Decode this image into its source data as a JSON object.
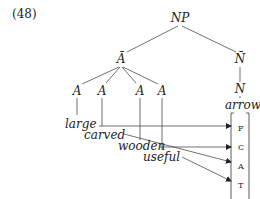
{
  "example_number": "(48)",
  "tree": {
    "root": "NP",
    "a_bar": "Ā",
    "n_bar": "N̄",
    "n": "N",
    "adjective_nodes": [
      "A",
      "A",
      "A",
      "A"
    ],
    "head_word": "arrow"
  },
  "adjectives": [
    {
      "word": "large",
      "target": "F"
    },
    {
      "word": "carved",
      "target": "A"
    },
    {
      "word": "wooden",
      "target": "C"
    },
    {
      "word": "useful",
      "target": "T"
    }
  ],
  "feature_slots": [
    "F",
    "C",
    "A",
    "T"
  ],
  "colors": {
    "line": "#333333",
    "text": "#222222",
    "background": "#ffffff"
  }
}
